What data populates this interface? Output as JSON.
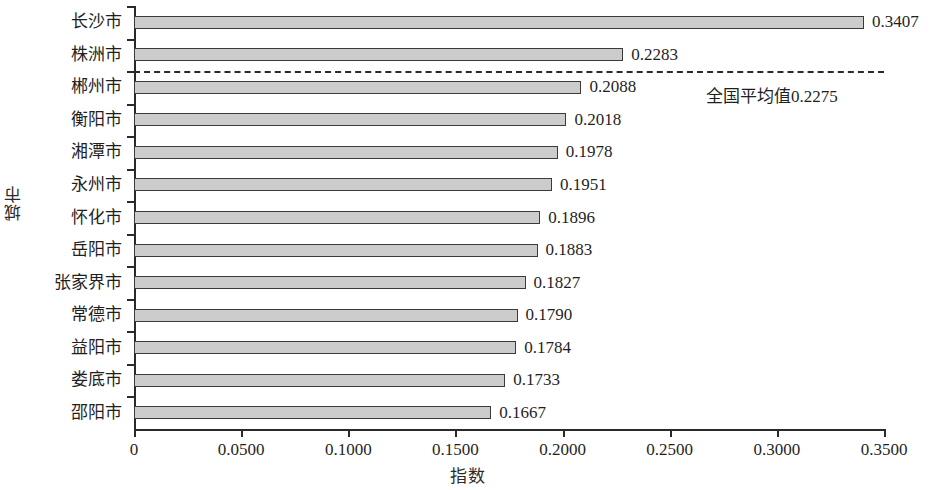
{
  "chart_data": {
    "type": "bar",
    "orientation": "horizontal",
    "title": "",
    "xlabel": "指数",
    "ylabel": "城市",
    "categories": [
      "长沙市",
      "株洲市",
      "郴州市",
      "衡阳市",
      "湘潭市",
      "永州市",
      "怀化市",
      "岳阳市",
      "张家界市",
      "常德市",
      "益阳市",
      "娄底市",
      "邵阳市"
    ],
    "values": [
      0.3407,
      0.2283,
      0.2088,
      0.2018,
      0.1978,
      0.1951,
      0.1896,
      0.1883,
      0.1827,
      0.179,
      0.1784,
      0.1733,
      0.1667
    ],
    "value_labels": [
      "0.3407",
      "0.2283",
      "0.2088",
      "0.2018",
      "0.1978",
      "0.1951",
      "0.1896",
      "0.1883",
      "0.1827",
      "0.1790",
      "0.1784",
      "0.1733",
      "0.1667"
    ],
    "xlim": [
      0,
      0.35
    ],
    "xticks": [
      0,
      0.05,
      0.1,
      0.15,
      0.2,
      0.25,
      0.3,
      0.35
    ],
    "xtick_labels": [
      "0",
      "0.0500",
      "0.1000",
      "0.1500",
      "0.2000",
      "0.2500",
      "0.3000",
      "0.3500"
    ],
    "grid": false,
    "legend": "none",
    "bar_fill_color": "#cccccc",
    "bar_edge_color": "#3a3a3a",
    "annotations": [
      {
        "name": "national-average",
        "label": "全国平均值0.2275",
        "value": 0.2275,
        "style": "dashed-horizontal-line"
      }
    ]
  }
}
